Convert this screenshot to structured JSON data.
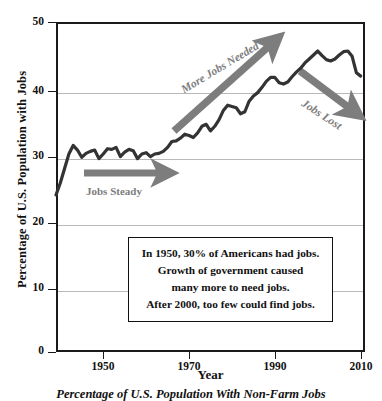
{
  "chart_data": {
    "type": "line",
    "title": "",
    "caption": "Percentage of U.S. Population With Non-Farm Jobs",
    "xlabel": "Year",
    "ylabel": "Percentage of U.S. Population with Jobs",
    "xlim": [
      1939,
      2011
    ],
    "ylim": [
      0,
      50
    ],
    "yticks": [
      0,
      10,
      20,
      30,
      40,
      50
    ],
    "xticks": [
      1950,
      1970,
      1990,
      2010
    ],
    "gridlines": [
      10,
      20,
      30,
      40
    ],
    "grid": true,
    "legend": "none",
    "line_color": "#333333",
    "series": [
      {
        "name": "Percentage of U.S. Population With Non-Farm Jobs",
        "x": [
          1939,
          1940,
          1941,
          1942,
          1943,
          1944,
          1945,
          1946,
          1947,
          1948,
          1949,
          1950,
          1951,
          1952,
          1953,
          1954,
          1955,
          1956,
          1957,
          1958,
          1959,
          1960,
          1961,
          1962,
          1963,
          1964,
          1965,
          1966,
          1967,
          1968,
          1969,
          1970,
          1971,
          1972,
          1973,
          1974,
          1975,
          1976,
          1977,
          1978,
          1979,
          1980,
          1981,
          1982,
          1983,
          1984,
          1985,
          1986,
          1987,
          1988,
          1989,
          1990,
          1991,
          1992,
          1993,
          1994,
          1995,
          1996,
          1997,
          1998,
          1999,
          2000,
          2001,
          2002,
          2003,
          2004,
          2005,
          2006,
          2007,
          2008,
          2009,
          2010
        ],
        "y": [
          23.8,
          25.6,
          27.8,
          30.0,
          31.3,
          30.6,
          29.5,
          30.1,
          30.4,
          30.6,
          29.3,
          30.0,
          30.8,
          30.7,
          31.0,
          29.6,
          30.3,
          30.7,
          30.5,
          29.3,
          30.0,
          30.2,
          29.6,
          30.0,
          30.1,
          30.4,
          31.0,
          31.9,
          32.0,
          32.4,
          33.0,
          32.8,
          32.5,
          33.2,
          34.2,
          34.5,
          33.5,
          34.2,
          35.2,
          36.6,
          37.4,
          37.2,
          37.0,
          36.1,
          36.4,
          38.0,
          38.8,
          39.3,
          40.1,
          41.0,
          41.6,
          41.6,
          40.8,
          40.6,
          40.9,
          41.7,
          42.4,
          43.0,
          43.8,
          44.4,
          45.0,
          45.6,
          44.9,
          44.3,
          44.1,
          44.4,
          45.0,
          45.5,
          45.6,
          44.8,
          42.3,
          41.8
        ]
      }
    ],
    "annotations": [
      {
        "id": "jobs-steady",
        "label": "Jobs Steady",
        "arrow": "right",
        "color": "#7d7d7d"
      },
      {
        "id": "more-jobs-needed",
        "label": "More Jobs Needed",
        "arrow": "up-right",
        "color": "#7d7d7d"
      },
      {
        "id": "jobs-lost",
        "label": "Jobs Lost",
        "arrow": "down-right",
        "color": "#7d7d7d"
      }
    ],
    "callout": {
      "lines": [
        "In 1950, 30% of Americans had jobs.",
        "Growth of government caused",
        "many more to need jobs.",
        "After 2000, too few could find jobs."
      ]
    }
  }
}
